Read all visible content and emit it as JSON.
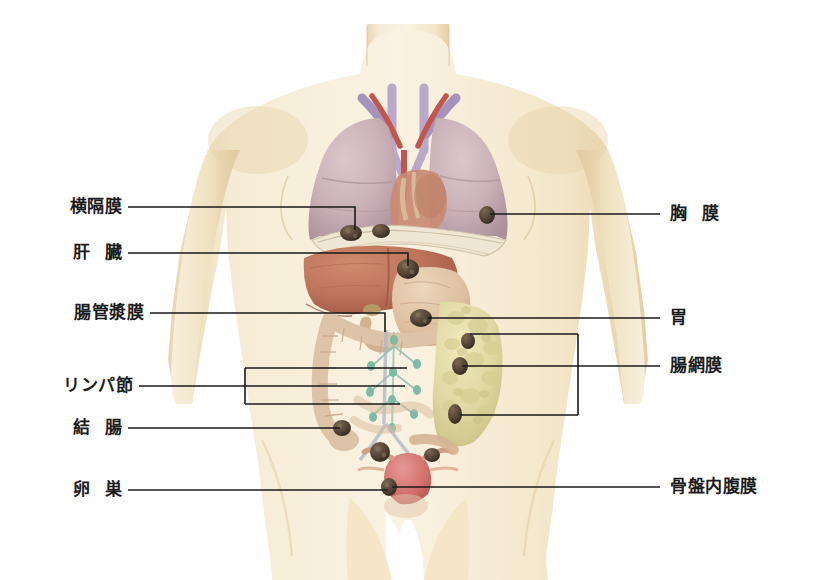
{
  "figure": {
    "colors": {
      "background": "#ffffff",
      "skin": "#f5e8cd",
      "skin_shadow": "#e8d4ad",
      "skin_edge": "#ddc79d",
      "lung": "#cbb3b8",
      "lung_shadow": "#b79ca4",
      "liver": "#c0785f",
      "liver_dark": "#a75f49",
      "stomach": "#ddbda0",
      "omentum": "#e2dca8",
      "omentum_dark": "#cfc88c",
      "colon": "#ddc3a8",
      "uterus": "#d98080",
      "vessel_artery": "#c2564f",
      "vessel_vein": "#8f7faa",
      "lymph": "#7fbfae",
      "tumor": "#5a4a3c",
      "leader": "#1a1a1a",
      "text": "#1c1c1c"
    }
  },
  "labels_left": [
    {
      "id": "diaphragm",
      "text_a": "横隔膜",
      "text_b": "",
      "name": "label-diaphragm"
    },
    {
      "id": "liver",
      "text_a": "肝",
      "text_b": "臓",
      "name": "label-liver"
    },
    {
      "id": "serosa",
      "text_a": "腸管漿膜",
      "text_b": "",
      "name": "label-intestinal-serosa"
    },
    {
      "id": "lymphnode",
      "text_a": "リンパ節",
      "text_b": "",
      "name": "label-lymph-node"
    },
    {
      "id": "colon",
      "text_a": "結",
      "text_b": "腸",
      "name": "label-colon"
    },
    {
      "id": "ovary",
      "text_a": "卵",
      "text_b": "巣",
      "name": "label-ovary"
    }
  ],
  "labels_right": [
    {
      "id": "pleura",
      "text_a": "胸",
      "text_b": "膜",
      "name": "label-pleura"
    },
    {
      "id": "stomach",
      "text_a": "胃",
      "text_b": "",
      "name": "label-stomach"
    },
    {
      "id": "omentum",
      "text_a": "腸網膜",
      "text_b": "",
      "name": "label-intestinal-omentum"
    },
    {
      "id": "pelvic",
      "text_a": "骨盤内腹膜",
      "text_b": "",
      "name": "label-pelvic-peritoneum"
    }
  ],
  "organs": [
    {
      "name": "right-lung",
      "label": "右肺"
    },
    {
      "name": "left-lung",
      "label": "左肺"
    },
    {
      "name": "heart",
      "label": "心臓"
    },
    {
      "name": "trachea",
      "label": "気管"
    },
    {
      "name": "diaphragm",
      "label": "横隔膜"
    },
    {
      "name": "liver",
      "label": "肝臓"
    },
    {
      "name": "stomach",
      "label": "胃"
    },
    {
      "name": "omentum",
      "label": "大網"
    },
    {
      "name": "colon",
      "label": "結腸"
    },
    {
      "name": "lymph-chain",
      "label": "リンパ節鎖"
    },
    {
      "name": "uterus",
      "label": "子宮"
    },
    {
      "name": "ovary-right",
      "label": "右卵巣"
    },
    {
      "name": "ovary-left",
      "label": "左卵巣"
    }
  ],
  "tumor_nodules": [
    {
      "name": "nodule-diaphragm-right",
      "x": 351,
      "y": 233
    },
    {
      "name": "nodule-diaphragm-mid",
      "x": 381,
      "y": 231
    },
    {
      "name": "nodule-pleura-left",
      "x": 487,
      "y": 215
    },
    {
      "name": "nodule-liver",
      "x": 408,
      "y": 269
    },
    {
      "name": "nodule-stomach",
      "x": 421,
      "y": 318
    },
    {
      "name": "nodule-omentum-upper",
      "x": 468,
      "y": 341
    },
    {
      "name": "nodule-omentum-mid",
      "x": 460,
      "y": 366
    },
    {
      "name": "nodule-omentum-lower",
      "x": 455,
      "y": 414
    },
    {
      "name": "nodule-colon",
      "x": 342,
      "y": 428
    },
    {
      "name": "nodule-ovary-right",
      "x": 380,
      "y": 452
    },
    {
      "name": "nodule-ovary-left",
      "x": 432,
      "y": 455
    },
    {
      "name": "nodule-pelvic",
      "x": 389,
      "y": 487
    }
  ]
}
